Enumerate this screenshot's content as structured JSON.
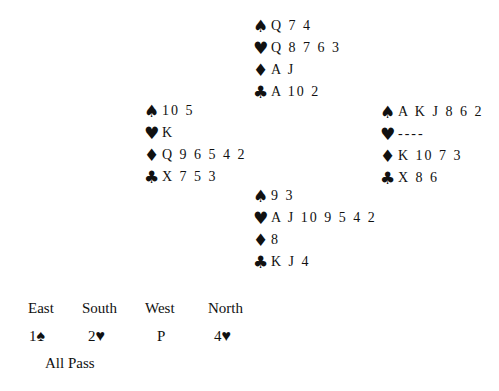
{
  "suit_icons": {
    "spade": "♠",
    "heart": "♥",
    "diamond": "♦",
    "club": "♣"
  },
  "hands": {
    "north": {
      "spades": "Q 7 4",
      "hearts": "Q 8 7 6 3",
      "diamonds": "A J",
      "clubs": "A 10 2"
    },
    "west": {
      "spades": "10 5",
      "hearts": "K",
      "diamonds": "Q 9 6 5 4 2",
      "clubs": "X 7 5 3"
    },
    "east": {
      "spades": "A K J 8 6 2",
      "hearts": "----",
      "diamonds": "K 10 7 3",
      "clubs": "X 8 6"
    },
    "south": {
      "spades": "9 3",
      "hearts": "A J 10 9 5 4 2",
      "diamonds": "8",
      "clubs": "K J 4"
    }
  },
  "bidding": {
    "headers": [
      "East",
      "South",
      "West",
      "North"
    ],
    "bids": [
      {
        "level": "1",
        "suit": "♠"
      },
      {
        "level": "2",
        "suit": "♥"
      },
      {
        "level": "P",
        "suit": ""
      },
      {
        "level": "4",
        "suit": "♥"
      }
    ],
    "final": "All Pass"
  }
}
